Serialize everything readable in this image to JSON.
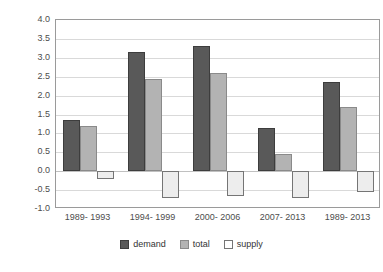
{
  "chart_data": {
    "type": "bar",
    "title": "",
    "xlabel": "",
    "ylabel": "",
    "ylim": [
      -1.0,
      4.0
    ],
    "ytick_step": 0.5,
    "grid": true,
    "legend_position": "bottom",
    "categories": [
      "1989- 1993",
      "1994- 1999",
      "2000- 2006",
      "2007- 2013",
      "1989- 2013"
    ],
    "yticks": [
      "4.0",
      "3.5",
      "3.0",
      "2.5",
      "2.0",
      "1.5",
      "1.0",
      "0.5",
      "0.0",
      "-0.5",
      "-1.0"
    ],
    "ytick_values": [
      4.0,
      3.5,
      3.0,
      2.5,
      2.0,
      1.5,
      1.0,
      0.5,
      0.0,
      -0.5,
      -1.0
    ],
    "series": [
      {
        "name": "demand",
        "color": "#595959",
        "values": [
          1.35,
          3.15,
          3.3,
          1.15,
          2.35
        ]
      },
      {
        "name": "total",
        "color": "#b3b3b3",
        "values": [
          1.2,
          2.45,
          2.6,
          0.45,
          1.7
        ]
      },
      {
        "name": "supply",
        "color": "#ededed",
        "values": [
          -0.2,
          -0.7,
          -0.65,
          -0.7,
          -0.55
        ]
      }
    ]
  },
  "legend": {
    "items": [
      {
        "label": "demand",
        "key": "demand"
      },
      {
        "label": "total",
        "key": "total"
      },
      {
        "label": "supply",
        "key": "supply"
      }
    ]
  }
}
